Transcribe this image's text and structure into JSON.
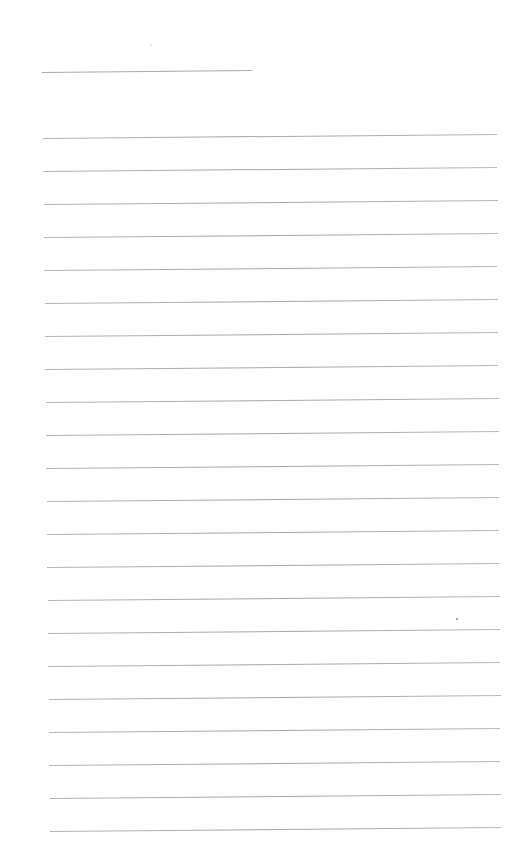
{
  "page": {
    "type": "lined-paper",
    "background": "#ffffff",
    "line_color": "#a8a8a8"
  },
  "header_line": {
    "x1": 42,
    "y1": 72,
    "x2": 252,
    "y2": 70
  },
  "ruled_lines": {
    "count": 22,
    "first_y": 138,
    "spacing": 33,
    "x_start_top": 43,
    "x_end_top": 497,
    "x_start_bottom": 50,
    "x_end_bottom": 501,
    "slope_px": -4
  },
  "marks": [
    {
      "x": 457,
      "y": 619,
      "kind": "dot"
    },
    {
      "x": 151,
      "y": 45,
      "kind": "faint-speck"
    }
  ]
}
